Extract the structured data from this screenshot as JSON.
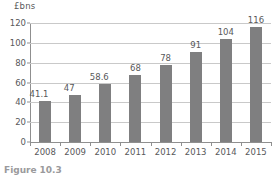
{
  "chart_data": {
    "type": "bar",
    "title": "",
    "subtitle": "",
    "xlabel": "",
    "ylabel": "£bns",
    "categories": [
      "2008",
      "2009",
      "2010",
      "2011",
      "2012",
      "2013",
      "2014",
      "2015"
    ],
    "values": [
      41.1,
      47,
      58.6,
      68,
      78,
      91,
      104,
      116
    ],
    "value_labels": [
      "41.1",
      "47",
      "58.6",
      "68",
      "78",
      "91",
      "104",
      "116"
    ],
    "ylim": [
      0,
      120
    ],
    "ytick_labels": [
      "0",
      "20",
      "40",
      "60",
      "80",
      "100",
      "120"
    ],
    "ytick_values": [
      0,
      20,
      40,
      60,
      80,
      100,
      120
    ],
    "grid": true,
    "grid_axis": "y",
    "legend": "none",
    "bar_color": "#7f7f80",
    "axis_color": "#8f8f8f",
    "grid_color": "#c9c9c9",
    "text_color": "#58585a"
  },
  "axis": {
    "unit_label": "£bns"
  },
  "caption": {
    "figure_label": "Figure",
    "figure_number": "10.3",
    "text": ""
  }
}
